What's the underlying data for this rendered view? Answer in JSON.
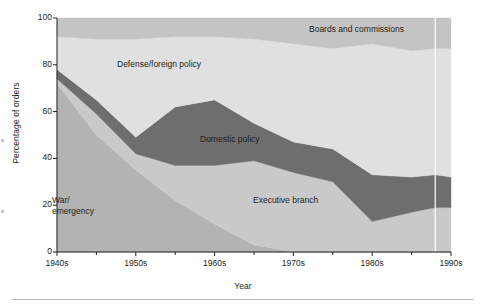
{
  "chart_data": {
    "type": "area",
    "title": "",
    "xlabel": "Year",
    "ylabel": "Percentage of orders",
    "xlim": [
      1940,
      1990
    ],
    "ylim": [
      0,
      100
    ],
    "grid": false,
    "legend_position": "inline-annotations",
    "stacked": true,
    "x": [
      1940,
      1945,
      1950,
      1955,
      1960,
      1965,
      1970,
      1975,
      1980,
      1985,
      1988,
      1990
    ],
    "xtick_labels": [
      "1940s",
      "1950s",
      "1960s",
      "1970s",
      "1980s",
      "1990s"
    ],
    "xtick_values": [
      1940,
      1950,
      1960,
      1970,
      1980,
      1990
    ],
    "ytick_labels": [
      "0",
      "20",
      "40",
      "60",
      "80",
      "100"
    ],
    "ytick_values": [
      0,
      20,
      40,
      60,
      80,
      100
    ],
    "series": [
      {
        "name": "War/emergency",
        "color": "#b3b3b3",
        "values": [
          72,
          50,
          35,
          22,
          12,
          3,
          0,
          0,
          0,
          0,
          0,
          0
        ]
      },
      {
        "name": "Executive branch",
        "color": "#c9c9c9",
        "values": [
          2,
          9,
          7,
          15,
          25,
          36,
          34,
          30,
          13,
          17,
          19,
          19
        ]
      },
      {
        "name": "Domestic policy",
        "color": "#6e6e6e",
        "values": [
          4,
          6,
          7,
          25,
          28,
          16,
          13,
          14,
          20,
          15,
          14,
          13
        ]
      },
      {
        "name": "Defense/foreign policy",
        "color": "#e0e0e0",
        "values": [
          14,
          26,
          42,
          30,
          27,
          36,
          42,
          43,
          56,
          54,
          54,
          55
        ]
      },
      {
        "name": "Boards and commissions",
        "color": "#c4c4c4",
        "values": [
          8,
          9,
          9,
          8,
          8,
          9,
          11,
          13,
          11,
          14,
          13,
          13
        ]
      }
    ],
    "annotations": [
      {
        "text": "Defense/foreign policy",
        "x": 1953,
        "y": 80
      },
      {
        "text": "Boards and commissions",
        "x": 1978,
        "y": 95
      },
      {
        "text": "Domestic policy",
        "x": 1962,
        "y": 48
      },
      {
        "text": "Executive branch",
        "x": 1969,
        "y": 22
      },
      {
        "text": "War/\nemergency",
        "x": 1942,
        "y": 20
      }
    ],
    "marker_line": {
      "x": 1988,
      "color": "#ffffff"
    }
  },
  "axes": {
    "y_title": "Percentage of orders",
    "x_title": "Year"
  }
}
